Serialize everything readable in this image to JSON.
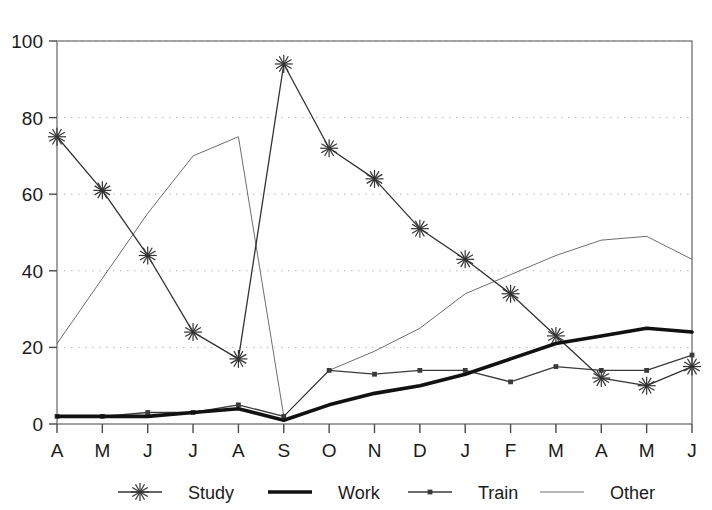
{
  "chart_data": {
    "type": "line",
    "title": "",
    "xlabel": "",
    "ylabel": "",
    "ylim": [
      0,
      100
    ],
    "yticks": [
      0,
      20,
      40,
      60,
      80,
      100
    ],
    "grid": "horizontal-dotted",
    "legend_position": "bottom",
    "categories": [
      "A",
      "M",
      "J",
      "J",
      "A",
      "S",
      "O",
      "N",
      "D",
      "J",
      "F",
      "M",
      "A",
      "M",
      "J"
    ],
    "series": [
      {
        "name": "Study",
        "marker": "asterisk",
        "line": "thin",
        "color": "#333333",
        "values": [
          75,
          61,
          44,
          24,
          17,
          94,
          72,
          64,
          51,
          43,
          34,
          23,
          12,
          10,
          15
        ]
      },
      {
        "name": "Work",
        "marker": "none",
        "line": "thick",
        "color": "#111111",
        "values": [
          2,
          2,
          2,
          3,
          4,
          1,
          5,
          8,
          10,
          13,
          17,
          21,
          23,
          25,
          24
        ]
      },
      {
        "name": "Train",
        "marker": "dot",
        "line": "thin",
        "color": "#3a3a3a",
        "values": [
          2,
          2,
          3,
          3,
          5,
          2,
          14,
          13,
          14,
          14,
          11,
          15,
          14,
          14,
          18
        ]
      },
      {
        "name": "Other",
        "marker": "none",
        "line": "hairline",
        "color": "#6e6e6e",
        "values": [
          21,
          38,
          55,
          70,
          75,
          2,
          14,
          19,
          25,
          34,
          39,
          44,
          48,
          49,
          43
        ]
      }
    ]
  },
  "axis": {
    "y_tick_labels": [
      "0",
      "20",
      "40",
      "60",
      "80",
      "100"
    ],
    "x_tick_labels": [
      "A",
      "M",
      "J",
      "J",
      "A",
      "S",
      "O",
      "N",
      "D",
      "J",
      "F",
      "M",
      "A",
      "M",
      "J"
    ]
  },
  "legend": {
    "entries": [
      {
        "label": "Study"
      },
      {
        "label": "Work"
      },
      {
        "label": "Train"
      },
      {
        "label": "Other"
      }
    ]
  }
}
